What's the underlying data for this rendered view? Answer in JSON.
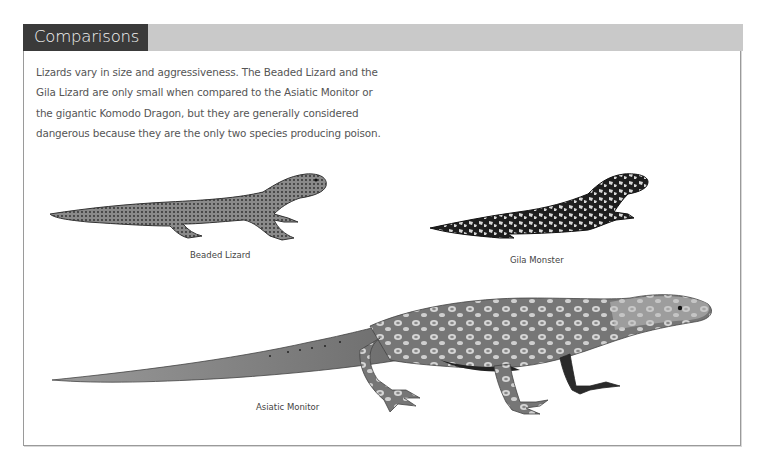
{
  "section": {
    "title": "Comparisons",
    "intro": "Lizards vary in size and aggressiveness. The Beaded Lizard and the Gila Lizard are only small when compared to the Asiatic Monitor or the gigantic Komodo Dragon, but they are generally considered dangerous because they are the only two species producing poison.",
    "intro_lines": [
      "Lizards vary in size and aggressiveness. The Beaded Lizard and the",
      "Gila Lizard are only small when compared to the Asiatic Monitor or",
      "the gigantic Komodo Dragon, but they are generally considered",
      "dangerous because they are the only two species producing poison."
    ]
  },
  "figures": [
    {
      "id": "beaded-lizard",
      "caption": "Beaded Lizard",
      "icon": "beaded-lizard-illustration"
    },
    {
      "id": "gila-monster",
      "caption": "Gila Monster",
      "icon": "gila-monster-illustration"
    },
    {
      "id": "asiatic-monitor",
      "caption": "Asiatic Monitor",
      "icon": "asiatic-monitor-illustration"
    }
  ],
  "colors": {
    "title_tab": "#3a3a3a",
    "header_bar": "#c9c9c9",
    "frame_border": "#9a9a9a",
    "text": "#555555"
  }
}
